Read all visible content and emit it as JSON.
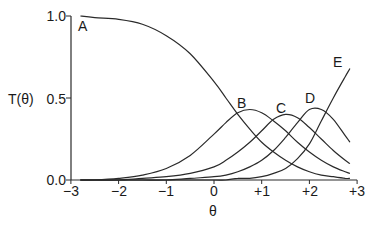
{
  "chart_data": {
    "type": "line",
    "title": "",
    "xlabel": "θ",
    "ylabel": "T(θ)",
    "xlim": [
      -3,
      3
    ],
    "ylim": [
      0,
      1
    ],
    "grid": false,
    "legend": "inline labels at curves",
    "x_ticks": [
      "−3",
      "−2",
      "−1",
      "0",
      "+1",
      "+2",
      "+3"
    ],
    "y_ticks": [
      "0.0",
      "0.5",
      "1.0"
    ],
    "x": [
      -2.8,
      -2.5,
      -2.0,
      -1.5,
      -1.0,
      -0.5,
      0.0,
      0.25,
      0.5,
      0.75,
      1.0,
      1.25,
      1.5,
      1.75,
      2.0,
      2.25,
      2.5,
      2.75,
      2.85
    ],
    "series": [
      {
        "name": "A",
        "values": [
          1.0,
          0.99,
          0.98,
          0.95,
          0.88,
          0.77,
          0.6,
          0.5,
          0.4,
          0.31,
          0.23,
          0.17,
          0.12,
          0.08,
          0.05,
          0.03,
          0.02,
          0.01,
          0.01
        ]
      },
      {
        "name": "B",
        "values": [
          0.0,
          0.0,
          0.01,
          0.03,
          0.07,
          0.15,
          0.28,
          0.35,
          0.41,
          0.43,
          0.41,
          0.36,
          0.3,
          0.23,
          0.17,
          0.12,
          0.08,
          0.05,
          0.04
        ]
      },
      {
        "name": "C",
        "values": [
          0.0,
          0.0,
          0.0,
          0.01,
          0.02,
          0.04,
          0.08,
          0.12,
          0.17,
          0.23,
          0.3,
          0.37,
          0.4,
          0.38,
          0.32,
          0.25,
          0.18,
          0.12,
          0.1
        ]
      },
      {
        "name": "D",
        "values": [
          0.0,
          0.0,
          0.0,
          0.0,
          0.0,
          0.01,
          0.02,
          0.03,
          0.05,
          0.08,
          0.12,
          0.18,
          0.26,
          0.35,
          0.43,
          0.43,
          0.37,
          0.27,
          0.23
        ]
      },
      {
        "name": "E",
        "values": [
          0.0,
          0.0,
          0.0,
          0.0,
          0.0,
          0.0,
          0.0,
          0.0,
          0.01,
          0.01,
          0.02,
          0.04,
          0.07,
          0.13,
          0.22,
          0.36,
          0.5,
          0.63,
          0.68
        ]
      }
    ],
    "annotations": [
      {
        "text": "A",
        "x": -2.8,
        "y": 0.95
      },
      {
        "text": "B",
        "x": 0.6,
        "y": 0.47
      },
      {
        "text": "C",
        "x": 1.45,
        "y": 0.44
      },
      {
        "text": "D",
        "x": 2.05,
        "y": 0.5
      },
      {
        "text": "E",
        "x": 2.7,
        "y": 0.72
      }
    ]
  },
  "style": {
    "line_color": "#2a2a2a",
    "axis_color": "#2a2a2a",
    "background": "#ffffff"
  }
}
